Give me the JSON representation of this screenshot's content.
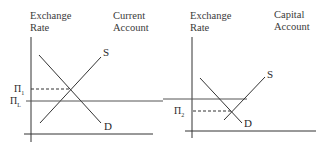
{
  "panels": [
    {
      "id": "current-account",
      "y_axis_label_line1": "Exchange",
      "y_axis_label_line2": "Rate",
      "title_line1": "Current",
      "title_line2": "Account",
      "supply_label": "S",
      "demand_label": "D",
      "equilibrium_price_symbol": "Π",
      "equilibrium_price_subscript": "1",
      "fixed_rate_symbol": "Π",
      "fixed_rate_subscript": "L"
    },
    {
      "id": "capital-account",
      "y_axis_label_line1": "Exchange",
      "y_axis_label_line2": "Rate",
      "title_line1": "Capital",
      "title_line2": "Account",
      "supply_label": "S",
      "demand_label": "D",
      "equilibrium_price_symbol": "Π",
      "equilibrium_price_subscript": "2"
    }
  ],
  "colors": {
    "line": "#333333",
    "text": "#2a2a2a",
    "background": "#ffffff"
  }
}
